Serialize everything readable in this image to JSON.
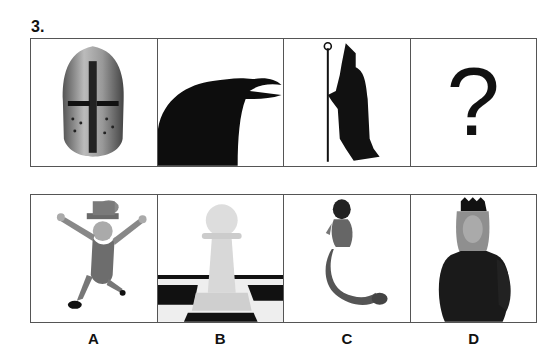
{
  "question": {
    "number": "3."
  },
  "sequence": [
    {
      "label": "knight-helmet",
      "icon": "helmet-icon"
    },
    {
      "label": "raven",
      "icon": "raven-icon"
    },
    {
      "label": "bishop-silhouette",
      "icon": "bishop-icon"
    },
    {
      "label": "unknown",
      "text": "?"
    }
  ],
  "options": [
    {
      "letter": "A",
      "label": "leprechaun",
      "icon": "leprechaun-icon"
    },
    {
      "letter": "B",
      "label": "chess-pawn",
      "icon": "pawn-icon"
    },
    {
      "letter": "C",
      "label": "mermaid",
      "icon": "mermaid-icon"
    },
    {
      "letter": "D",
      "label": "queen",
      "icon": "queen-icon"
    }
  ]
}
